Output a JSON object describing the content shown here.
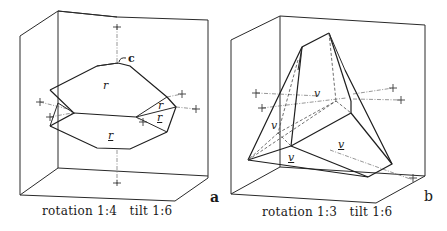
{
  "panels": [
    {
      "id": "a",
      "letter": "a",
      "caption": "rotation 1:4   tilt 1:6",
      "face_labels": {
        "c": "c",
        "r_top": "r",
        "r_right_upper": "r",
        "r_right_lower": "r",
        "r_bottom": "r"
      }
    },
    {
      "id": "b",
      "letter": "b",
      "caption": "rotation 1:3   tilt 1:6",
      "face_labels": {
        "v_center": "v",
        "v_left": "v",
        "v_right_lower": "v",
        "v_bottom": "v"
      }
    }
  ]
}
